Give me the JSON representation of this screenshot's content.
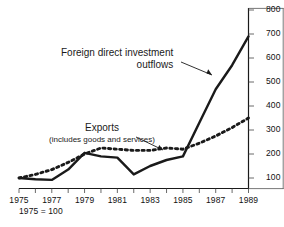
{
  "chart_data": {
    "type": "line",
    "title": "",
    "subtitle": "",
    "xlabel": "",
    "ylabel": "",
    "footnote": "1975 = 100",
    "grid": false,
    "legend_position": "inline-annotations",
    "xlim": [
      1975,
      1989
    ],
    "ylim": [
      0,
      800
    ],
    "yticks": [
      100,
      200,
      300,
      400,
      500,
      600,
      700,
      800
    ],
    "ytick_labels": [
      "100",
      "200",
      "300",
      "400",
      "500",
      "600",
      "700",
      "800"
    ],
    "x": [
      1975,
      1976,
      1977,
      1978,
      1979,
      1980,
      1981,
      1982,
      1983,
      1984,
      1985,
      1986,
      1987,
      1988,
      1989
    ],
    "xticks": [
      1975,
      1976,
      1977,
      1978,
      1979,
      1980,
      1981,
      1982,
      1983,
      1984,
      1985,
      1986,
      1987,
      1988,
      1989
    ],
    "xtick_labels": [
      "1975",
      "",
      "1977",
      "",
      "1979",
      "",
      "1981",
      "",
      "1983",
      "",
      "1985",
      "",
      "1987",
      "",
      "1989"
    ],
    "xtick_labels_shown": [
      "1975",
      "1977",
      "1979",
      "1981",
      "1983",
      "1985",
      "1987",
      "1989"
    ],
    "series": [
      {
        "name": "Foreign direct investment outflows",
        "style": "solid",
        "color": "#1a1a1a",
        "values": [
          100,
          95,
          92,
          135,
          205,
          190,
          185,
          115,
          150,
          175,
          190,
          330,
          470,
          570,
          690
        ]
      },
      {
        "name": "Exports (includes goods and services)",
        "style": "dotted",
        "color": "#1a1a1a",
        "values": [
          100,
          115,
          135,
          165,
          200,
          225,
          220,
          215,
          215,
          225,
          220,
          245,
          275,
          310,
          350
        ]
      }
    ],
    "annotations": [
      {
        "name": "fdi-annotation",
        "line1": "Foreign direct investment",
        "line2": "outflows",
        "target_x": 1987,
        "target_y": 470
      },
      {
        "name": "exports-annotation",
        "line1": "Exports",
        "line2": "(includes goods and services)",
        "target_x": 1984,
        "target_y": 225
      }
    ]
  }
}
